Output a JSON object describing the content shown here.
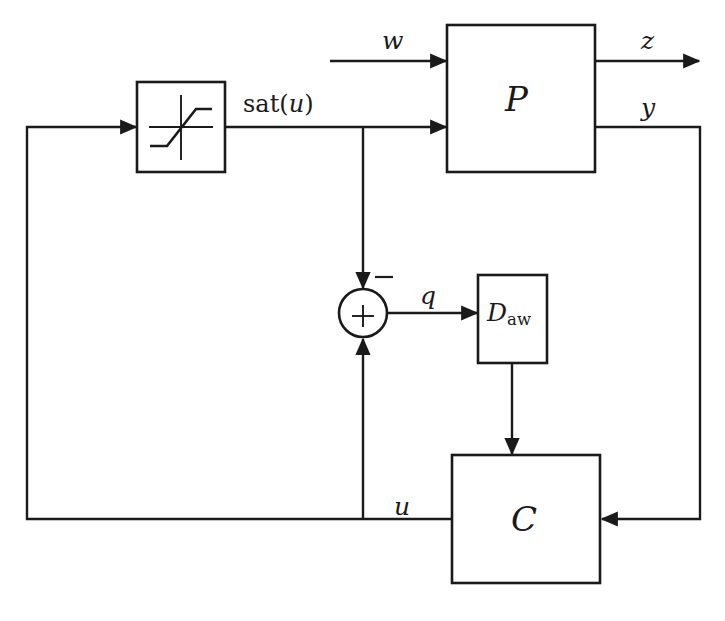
{
  "diagram": {
    "type": "control-block-diagram",
    "background_color": "#ffffff",
    "line_color": "#1a1a1a",
    "blocks": [
      {
        "id": "saturation",
        "name": "saturation-nonlinearity-block",
        "label": "",
        "shape": "square-with-saturation-curve",
        "x": 137,
        "y": 82,
        "width": 88,
        "height": 90
      },
      {
        "id": "plant",
        "name": "plant-block",
        "label": "P",
        "shape": "rectangle",
        "x": 447,
        "y": 25,
        "width": 148,
        "height": 147
      },
      {
        "id": "sum",
        "name": "summing-junction",
        "label": "+",
        "shape": "circle",
        "cx": 363,
        "cy": 313,
        "r": 24
      },
      {
        "id": "daw",
        "name": "anti-windup-compensator-block",
        "label": "D",
        "label_subscript": "aw",
        "shape": "rectangle",
        "x": 478,
        "y": 275,
        "width": 69,
        "height": 88
      },
      {
        "id": "controller",
        "name": "controller-block",
        "label": "C",
        "shape": "rectangle",
        "x": 452,
        "y": 455,
        "width": 148,
        "height": 128
      }
    ],
    "signals": [
      {
        "id": "w",
        "label": "w",
        "name": "signal-label-w",
        "from": "external-input",
        "to": "plant"
      },
      {
        "id": "z",
        "label": "z",
        "name": "signal-label-z",
        "from": "plant",
        "to": "external-output"
      },
      {
        "id": "y",
        "label": "y",
        "name": "signal-label-y",
        "from": "plant",
        "to": "controller"
      },
      {
        "id": "sat_u",
        "label": "sat(u)",
        "name": "signal-label-sat-u",
        "from": "saturation",
        "to": "plant"
      },
      {
        "id": "u",
        "label": "u",
        "name": "signal-label-u",
        "from": "controller",
        "to": "saturation"
      },
      {
        "id": "q",
        "label": "q",
        "name": "signal-label-q",
        "from": "summing-junction",
        "to": "anti-windup-compensator-block"
      },
      {
        "id": "minus",
        "label": "−",
        "name": "sum-minus-sign",
        "from": "sat(u) branch",
        "to": "summing-junction"
      },
      {
        "id": "plus",
        "label": "+",
        "name": "sum-plus-sign",
        "from": "u branch",
        "to": "summing-junction"
      }
    ]
  }
}
